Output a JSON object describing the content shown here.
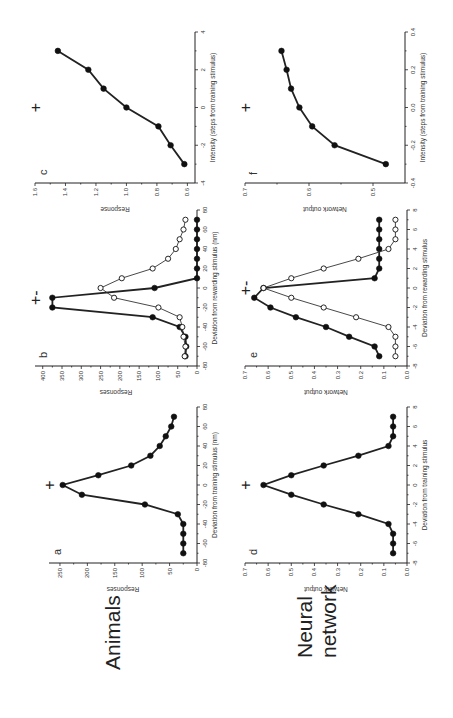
{
  "figure": {
    "orientation": "rotated 90 degrees counter-clockwise on page",
    "row_labels": [
      "Animals",
      "Neural network"
    ],
    "row_label_lines": [
      [
        "Animals"
      ],
      [
        "Neural",
        "network"
      ]
    ]
  },
  "chart_data": [
    {
      "panel": "a",
      "row": "Animals",
      "type": "line",
      "title": "",
      "annotation": "+",
      "annotation_x": 0,
      "xlabel": "Deviation from training stimulus (nm)",
      "ylabel": "Responses",
      "xlim": [
        -80,
        80
      ],
      "ylim": [
        0,
        270
      ],
      "xticks": [
        -80,
        -60,
        -40,
        -20,
        0,
        20,
        40,
        60,
        80
      ],
      "yticks": [
        0,
        50,
        100,
        150,
        200,
        250
      ],
      "grid": false,
      "series": [
        {
          "name": "responses",
          "marker": "filled",
          "x": [
            -70,
            -60,
            -50,
            -40,
            -30,
            -20,
            -10,
            0,
            10,
            20,
            30,
            40,
            50,
            60,
            70
          ],
          "y": [
            25,
            25,
            25,
            25,
            35,
            95,
            210,
            245,
            180,
            120,
            85,
            68,
            57,
            47,
            42
          ]
        }
      ]
    },
    {
      "panel": "b",
      "row": "Animals",
      "type": "line",
      "title": "",
      "annotation": "+ -",
      "annotation_x": -10,
      "xlabel": "Deviation from rewarding stimulus (nm)",
      "ylabel": "Responses",
      "xlim": [
        -80,
        80
      ],
      "ylim": [
        0,
        420
      ],
      "xticks": [
        -80,
        -60,
        -40,
        -20,
        0,
        20,
        40,
        60,
        80
      ],
      "yticks": [
        0,
        50,
        100,
        150,
        200,
        250,
        300,
        350,
        400
      ],
      "grid": false,
      "series": [
        {
          "name": "filled",
          "marker": "filled",
          "x": [
            -70,
            -60,
            -50,
            -40,
            -30,
            -20,
            -10,
            0,
            10,
            20,
            30,
            40,
            50,
            60,
            70
          ],
          "y": [
            30,
            28,
            30,
            45,
            115,
            375,
            375,
            110,
            0,
            0,
            0,
            0,
            0,
            0,
            0
          ]
        },
        {
          "name": "open",
          "marker": "open",
          "x": [
            -70,
            -60,
            -50,
            -40,
            -30,
            -20,
            -10,
            0,
            10,
            20,
            30,
            40,
            50,
            60,
            70
          ],
          "y": [
            32,
            30,
            35,
            38,
            45,
            100,
            215,
            250,
            195,
            115,
            75,
            55,
            45,
            35,
            30
          ]
        }
      ]
    },
    {
      "panel": "c",
      "row": "Animals",
      "type": "line",
      "title": "",
      "annotation": "+",
      "annotation_x": 0,
      "xlabel": "Intensity (steps from training stimulus)",
      "ylabel": "Response",
      "xlim": [
        -4,
        4
      ],
      "ylim": [
        0.55,
        1.6
      ],
      "xticks": [
        -4,
        -2,
        0,
        2,
        4
      ],
      "yticks": [
        0.6,
        0.8,
        1.0,
        1.2,
        1.4,
        1.6
      ],
      "grid": false,
      "series": [
        {
          "name": "response",
          "marker": "filled",
          "x": [
            -3,
            -2,
            -1,
            0,
            1,
            2,
            3
          ],
          "y": [
            0.62,
            0.71,
            0.79,
            1.0,
            1.15,
            1.25,
            1.45
          ]
        }
      ]
    },
    {
      "panel": "d",
      "row": "Neural network",
      "type": "line",
      "title": "",
      "annotation": "+",
      "annotation_x": 0,
      "xlabel": "Deviation from training stimulus",
      "ylabel": "Network output",
      "xlim": [
        -8,
        8
      ],
      "ylim": [
        0,
        0.7
      ],
      "xticks": [
        -8,
        -6,
        -4,
        -2,
        0,
        2,
        4,
        6,
        8
      ],
      "yticks": [
        0.0,
        0.1,
        0.2,
        0.3,
        0.4,
        0.5,
        0.6,
        0.7
      ],
      "grid": false,
      "series": [
        {
          "name": "output",
          "marker": "filled",
          "x": [
            -7,
            -6,
            -5,
            -4,
            -3,
            -2,
            -1,
            0,
            1,
            2,
            3,
            4,
            5,
            6,
            7
          ],
          "y": [
            0.06,
            0.06,
            0.06,
            0.08,
            0.21,
            0.36,
            0.5,
            0.62,
            0.5,
            0.36,
            0.21,
            0.08,
            0.06,
            0.06,
            0.06
          ]
        }
      ]
    },
    {
      "panel": "e",
      "row": "Neural network",
      "type": "line",
      "title": "",
      "annotation": "+ -",
      "annotation_x": 0,
      "xlabel": "Deviation from rewarding stimulus",
      "ylabel": "Network output",
      "xlim": [
        -8,
        8
      ],
      "ylim": [
        0,
        0.7
      ],
      "xticks": [
        -8,
        -6,
        -4,
        -2,
        0,
        2,
        4,
        6,
        8
      ],
      "yticks": [
        0.0,
        0.1,
        0.2,
        0.3,
        0.4,
        0.5,
        0.6,
        0.7
      ],
      "grid": false,
      "series": [
        {
          "name": "filled",
          "marker": "filled",
          "x": [
            -7,
            -6,
            -5,
            -4,
            -3,
            -2,
            -1,
            0,
            1,
            2,
            3,
            4,
            5,
            6,
            7
          ],
          "y": [
            0.12,
            0.14,
            0.25,
            0.35,
            0.48,
            0.59,
            0.66,
            0.62,
            0.14,
            0.12,
            0.12,
            0.12,
            0.12,
            0.12,
            0.12
          ]
        },
        {
          "name": "open",
          "marker": "open",
          "x": [
            -7,
            -6,
            -5,
            -4,
            -3,
            -2,
            -1,
            0,
            1,
            2,
            3,
            4,
            5,
            6,
            7
          ],
          "y": [
            0.05,
            0.05,
            0.05,
            0.08,
            0.22,
            0.36,
            0.5,
            0.62,
            0.5,
            0.36,
            0.21,
            0.08,
            0.05,
            0.05,
            0.05
          ]
        }
      ]
    },
    {
      "panel": "f",
      "row": "Neural network",
      "type": "line",
      "title": "",
      "annotation": "+",
      "annotation_x": 0.0,
      "xlabel": "Intensity (steps from training stimulus)",
      "ylabel": "Network output",
      "xlim": [
        -0.4,
        0.4
      ],
      "ylim": [
        0.45,
        0.7
      ],
      "xticks": [
        -0.4,
        -0.2,
        0.0,
        0.2,
        0.4
      ],
      "yticks": [
        0.5,
        0.6,
        0.7
      ],
      "grid": false,
      "series": [
        {
          "name": "output",
          "marker": "filled",
          "x": [
            -0.3,
            -0.2,
            -0.1,
            0.0,
            0.1,
            0.2,
            0.3
          ],
          "y": [
            0.48,
            0.56,
            0.595,
            0.615,
            0.628,
            0.635,
            0.643
          ]
        }
      ]
    }
  ]
}
